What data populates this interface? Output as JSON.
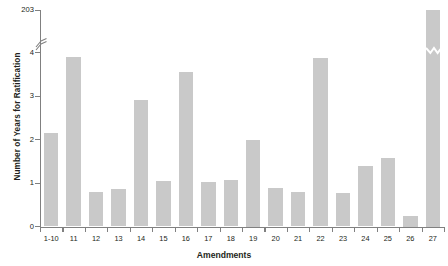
{
  "chart_data": {
    "type": "bar",
    "title": "",
    "xlabel": "Amendments",
    "ylabel": "Number of Years for Ratification",
    "categories": [
      "1-10",
      "11",
      "12",
      "13",
      "14",
      "15",
      "16",
      "17",
      "18",
      "19",
      "20",
      "21",
      "22",
      "23",
      "24",
      "25",
      "26",
      "27"
    ],
    "values": [
      2.16,
      3.9,
      0.8,
      0.87,
      2.9,
      1.05,
      3.55,
      1.02,
      1.08,
      2.0,
      0.88,
      0.8,
      3.88,
      0.77,
      1.4,
      1.58,
      0.25,
      203
    ],
    "ylim": [
      0,
      4
    ],
    "y_ticks": [
      "0",
      "1",
      "2",
      "3",
      "4",
      "203"
    ],
    "y_axis_broken": true,
    "y_break_between": [
      4,
      203
    ],
    "grid": false,
    "legend": null,
    "bar_color": "#c9c9c9",
    "axis_color": "#808080",
    "text_color": "#231f20"
  },
  "axes": {
    "y_title": "Number of Years for Ratification",
    "x_title": "Amendments"
  }
}
